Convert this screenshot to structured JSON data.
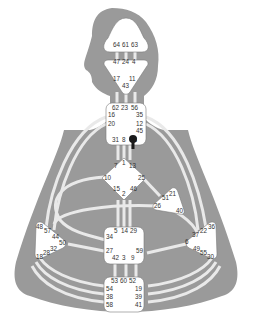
{
  "diagram": {
    "type": "human-design-bodygraph",
    "colors": {
      "background": "#ffffff",
      "silhouette": "#9a9a9a",
      "channel": "#e9e9e9",
      "center_fill": "#ffffff",
      "center_stroke": "#7a7a7a",
      "gate_text": "#333333",
      "marker": "#1a1a1a"
    },
    "centers": {
      "head": {
        "name": "Head",
        "gates": [
          "64",
          "61",
          "63"
        ]
      },
      "ajna": {
        "name": "Ajna",
        "gates": [
          "47",
          "24",
          "4",
          "17",
          "11",
          "43"
        ]
      },
      "throat": {
        "name": "Throat",
        "gates": [
          "62",
          "23",
          "56",
          "16",
          "35",
          "20",
          "12",
          "45",
          "31",
          "8",
          "33"
        ]
      },
      "g": {
        "name": "G Center",
        "gates": [
          "1",
          "7",
          "13",
          "10",
          "25",
          "15",
          "2",
          "46"
        ]
      },
      "heart": {
        "name": "Heart / Ego",
        "gates": [
          "21",
          "51",
          "26",
          "40"
        ]
      },
      "spleen": {
        "name": "Spleen",
        "gates": [
          "48",
          "57",
          "44",
          "50",
          "32",
          "28",
          "18"
        ]
      },
      "solar_plexus": {
        "name": "Solar Plexus",
        "gates": [
          "36",
          "22",
          "37",
          "6",
          "49",
          "55",
          "30"
        ]
      },
      "sacral": {
        "name": "Sacral",
        "gates": [
          "5",
          "14",
          "29",
          "34",
          "27",
          "59",
          "42",
          "3",
          "9"
        ]
      },
      "root": {
        "name": "Root",
        "gates": [
          "53",
          "60",
          "52",
          "54",
          "19",
          "38",
          "39",
          "58",
          "41"
        ]
      }
    },
    "marker": {
      "label": "activation-marker",
      "gate": "45"
    }
  }
}
